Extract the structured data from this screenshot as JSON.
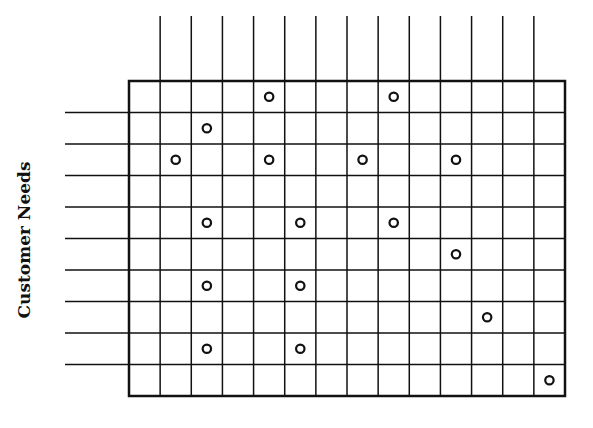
{
  "diagram": {
    "type": "relationship-matrix",
    "row_axis_label": "Customer Needs",
    "rows": 10,
    "columns": 14,
    "box": {
      "left": 129,
      "top": 81,
      "right": 565,
      "bottom": 396
    },
    "column_lines_top": 16,
    "row_lines_left": 65,
    "line_color": "#111111",
    "marker": "open-circle",
    "relationships": [
      {
        "row": 0,
        "col": 4
      },
      {
        "row": 0,
        "col": 8
      },
      {
        "row": 1,
        "col": 2
      },
      {
        "row": 2,
        "col": 1
      },
      {
        "row": 2,
        "col": 4
      },
      {
        "row": 2,
        "col": 7
      },
      {
        "row": 2,
        "col": 10
      },
      {
        "row": 4,
        "col": 2
      },
      {
        "row": 4,
        "col": 5
      },
      {
        "row": 4,
        "col": 8
      },
      {
        "row": 5,
        "col": 10
      },
      {
        "row": 6,
        "col": 2
      },
      {
        "row": 6,
        "col": 5
      },
      {
        "row": 7,
        "col": 11
      },
      {
        "row": 8,
        "col": 2
      },
      {
        "row": 8,
        "col": 5
      },
      {
        "row": 9,
        "col": 13
      }
    ]
  }
}
